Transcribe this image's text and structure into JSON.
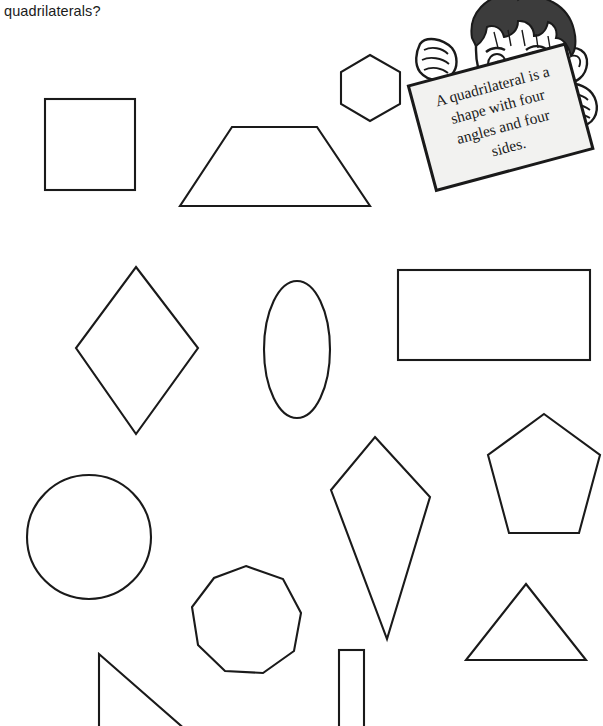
{
  "page": {
    "width": 603,
    "height": 726,
    "background": "#ffffff",
    "ink_color": "#1a1a1a",
    "text_color": "#1b1b1b"
  },
  "question": {
    "text": "quadrilaterals?"
  },
  "character": {
    "name": "cartoon-boy-holding-sign",
    "hair_color": "#3c3c3c",
    "skin_color": "#ffffff",
    "sign_color": "#f2f2f0",
    "sign_lines": [
      "A quadrilateral is a",
      "shape with four",
      "angles and four",
      "sides."
    ],
    "sign_text": "A quadrilateral is a shape with four angles and four sides."
  },
  "shapes": [
    {
      "id": "square",
      "label": "Square",
      "sides": 4,
      "is_quadrilateral": true,
      "x": 45,
      "y": 99,
      "width": 90,
      "height": 91
    },
    {
      "id": "trapezoid",
      "label": "Trapezoid",
      "sides": 4,
      "is_quadrilateral": true,
      "x": 179,
      "y": 126,
      "width": 192,
      "height": 81
    },
    {
      "id": "hexagon",
      "label": "Hexagon",
      "sides": 6,
      "is_quadrilateral": false,
      "x": 341,
      "y": 55,
      "width": 59,
      "height": 66
    },
    {
      "id": "rhombus",
      "label": "Rhombus",
      "sides": 4,
      "is_quadrilateral": true,
      "x": 76,
      "y": 267,
      "width": 122,
      "height": 167
    },
    {
      "id": "ellipse",
      "label": "Ellipse",
      "sides": 0,
      "is_quadrilateral": false,
      "x": 264,
      "y": 281,
      "width": 66,
      "height": 137
    },
    {
      "id": "rectangle-wide",
      "label": "Rectangle",
      "sides": 4,
      "is_quadrilateral": true,
      "x": 398,
      "y": 270,
      "width": 192,
      "height": 90
    },
    {
      "id": "circle",
      "label": "Circle",
      "sides": 0,
      "is_quadrilateral": false,
      "x": 27,
      "y": 474,
      "width": 124,
      "height": 126
    },
    {
      "id": "kite",
      "label": "Kite",
      "sides": 4,
      "is_quadrilateral": true,
      "x": 331,
      "y": 437,
      "width": 99,
      "height": 202
    },
    {
      "id": "pentagon",
      "label": "Pentagon",
      "sides": 5,
      "is_quadrilateral": false,
      "x": 488,
      "y": 414,
      "width": 112,
      "height": 119
    },
    {
      "id": "nonagon",
      "label": "Nonagon",
      "sides": 9,
      "is_quadrilateral": false,
      "x": 192,
      "y": 566,
      "width": 109,
      "height": 107
    },
    {
      "id": "triangle",
      "label": "Triangle",
      "sides": 3,
      "is_quadrilateral": false,
      "x": 466,
      "y": 584,
      "width": 120,
      "height": 77
    },
    {
      "id": "right-triangle",
      "label": "Right triangle",
      "sides": 3,
      "is_quadrilateral": false,
      "x": 98,
      "y": 654,
      "width": 105,
      "height": 72
    },
    {
      "id": "rectangle-narrow",
      "label": "Narrow rectangle",
      "sides": 4,
      "is_quadrilateral": true,
      "x": 339,
      "y": 650,
      "width": 25,
      "height": 76
    }
  ]
}
